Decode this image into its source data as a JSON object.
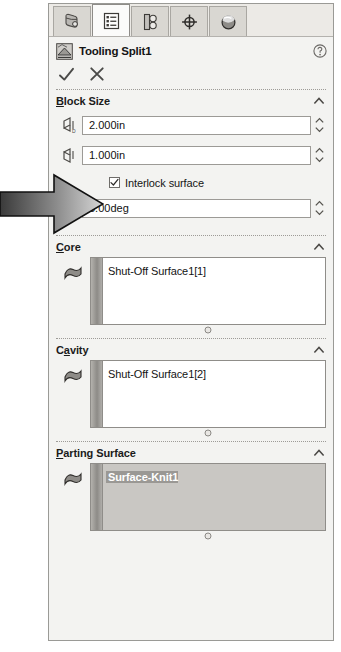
{
  "panel": {
    "title": "Tooling Split1",
    "help_icon": "help-question-icon",
    "title_icon": "tooling-split-icon",
    "accept_icon": "checkmark-icon",
    "cancel_icon": "close-x-icon"
  },
  "tabs": [
    {
      "name": "feature-manager-design-tree-tab",
      "icon": "part-tree-icon",
      "active": false
    },
    {
      "name": "property-manager-tab",
      "icon": "property-list-icon",
      "active": true
    },
    {
      "name": "configuration-manager-tab",
      "icon": "configuration-icon",
      "active": false
    },
    {
      "name": "dimxpert-manager-tab",
      "icon": "crosshair-target-icon",
      "active": false
    },
    {
      "name": "display-manager-tab",
      "icon": "appearance-sphere-icon",
      "active": false
    }
  ],
  "annotation": {
    "arrow_name": "callout-arrow",
    "points_to": "interlock-surface-checkbox"
  },
  "sections": [
    {
      "id": "block-size",
      "title": "Block Size",
      "mnemonic": "B",
      "collapse_icon": "chevron-up-icon",
      "fields": [
        {
          "name": "core-block-depth-field",
          "icon": "depth-above-parting-icon",
          "value": "2.000in",
          "spinner": "spin-up-down-icon"
        },
        {
          "name": "cavity-block-depth-field",
          "icon": "depth-below-parting-icon",
          "value": "1.000in",
          "spinner": "spin-up-down-icon"
        }
      ],
      "checkbox": {
        "name": "interlock-surface-checkbox",
        "label": "Interlock surface",
        "mnemonic": "I",
        "checked": true
      },
      "draft": {
        "name": "interlock-draft-angle-field",
        "icon": "draft-angle-icon",
        "value": "5.00deg",
        "spinner": "spin-up-down-icon"
      }
    },
    {
      "id": "core",
      "title": "Core",
      "mnemonic": "C",
      "collapse_icon": "chevron-up-icon",
      "select_icon": "face-surface-select-icon",
      "items": [
        {
          "label": "Shut-Off Surface1[1]",
          "selected": false
        }
      ],
      "highlighted": false
    },
    {
      "id": "cavity",
      "title": "Cavity",
      "mnemonic": "a",
      "collapse_icon": "chevron-up-icon",
      "select_icon": "face-surface-select-icon",
      "items": [
        {
          "label": "Shut-Off Surface1[2]",
          "selected": false
        }
      ],
      "highlighted": false
    },
    {
      "id": "parting-surface",
      "title": "Parting Surface",
      "mnemonic": "P",
      "collapse_icon": "chevron-up-icon",
      "select_icon": "face-surface-select-icon",
      "items": [
        {
          "label": "Surface-Knit1",
          "selected": true
        }
      ],
      "highlighted": true
    }
  ],
  "colors": {
    "panel_bg": "#f3f3f1",
    "panel_border": "#9a9a96",
    "field_bg": "#ffffff",
    "selection_highlight": "#9a9894",
    "list_highlight_bg": "#c9c7c3"
  }
}
